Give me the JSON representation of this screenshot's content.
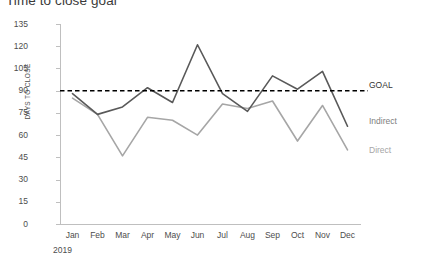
{
  "title": "Time to close goal",
  "axes": {
    "y_title": "DAYS TO CLOSE",
    "y_ticks": [
      "0",
      "15",
      "30",
      "45",
      "60",
      "75",
      "90",
      "105",
      "120",
      "135"
    ],
    "x_ticks": [
      "Jan",
      "Feb",
      "Mar",
      "Apr",
      "May",
      "Jun",
      "Jul",
      "Aug",
      "Sep",
      "Oct",
      "Nov",
      "Dec"
    ],
    "x_year": "2019"
  },
  "legend": {
    "goal": "GOAL",
    "indirect": "Indirect",
    "direct": "Direct"
  },
  "colors": {
    "goal": "#000000",
    "indirect": "#595959",
    "direct": "#a6a6a6",
    "axis": "#bfbfbf",
    "text": "#4d4d4d"
  },
  "chart_data": {
    "type": "line",
    "title": "Time to close goal",
    "xlabel": "2019",
    "ylabel": "DAYS TO CLOSE",
    "ylim": [
      0,
      135
    ],
    "ytick_step": 15,
    "grid": false,
    "legend_position": "right",
    "categories": [
      "Jan",
      "Feb",
      "Mar",
      "Apr",
      "May",
      "Jun",
      "Jul",
      "Aug",
      "Sep",
      "Oct",
      "Nov",
      "Dec"
    ],
    "series": [
      {
        "name": "Indirect",
        "color": "#595959",
        "style": "solid",
        "values": [
          88,
          74,
          79,
          92,
          82,
          121,
          88,
          76,
          100,
          91,
          103,
          66
        ]
      },
      {
        "name": "Direct",
        "color": "#a6a6a6",
        "style": "solid",
        "values": [
          85,
          74,
          46,
          72,
          70,
          60,
          81,
          78,
          83,
          56,
          80,
          50
        ]
      }
    ],
    "reference_line": {
      "name": "GOAL",
      "value": 90,
      "color": "#000000",
      "style": "dashed"
    }
  }
}
